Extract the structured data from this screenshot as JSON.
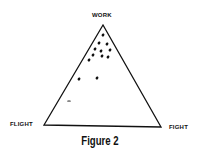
{
  "figure": {
    "caption": "Figure 2",
    "vertices": {
      "top": "WORK",
      "left": "FLIGHT",
      "right": "FIGHT"
    },
    "ink_color": "#111111"
  },
  "chart_data": {
    "type": "scatter",
    "subtype": "ternary",
    "title": "Figure 2",
    "axes": [
      "WORK",
      "FLIGHT",
      "FIGHT"
    ],
    "points_px": [
      {
        "x": 103,
        "y": 35
      },
      {
        "x": 99,
        "y": 43
      },
      {
        "x": 107,
        "y": 44
      },
      {
        "x": 95,
        "y": 49
      },
      {
        "x": 101,
        "y": 51
      },
      {
        "x": 110,
        "y": 50
      },
      {
        "x": 93,
        "y": 55
      },
      {
        "x": 102,
        "y": 56
      },
      {
        "x": 108,
        "y": 57
      },
      {
        "x": 89,
        "y": 60
      },
      {
        "x": 79,
        "y": 79
      },
      {
        "x": 97,
        "y": 78
      },
      {
        "x": 69,
        "y": 101
      }
    ],
    "note": "Points clustered near WORK vertex, a few trailing toward FLIGHT"
  }
}
